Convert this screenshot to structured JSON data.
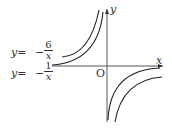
{
  "diagram": {
    "axis_x_label": "x",
    "axis_y_label": "y",
    "origin_label": "O",
    "curves": [
      {
        "label_lhs": "y=",
        "sign": "−",
        "numerator": "6",
        "denominator": "x",
        "equation": "y=-6/x"
      },
      {
        "label_lhs": "y=",
        "sign": "−",
        "numerator": "1",
        "denominator": "x",
        "equation": "y=-1/x"
      }
    ]
  }
}
